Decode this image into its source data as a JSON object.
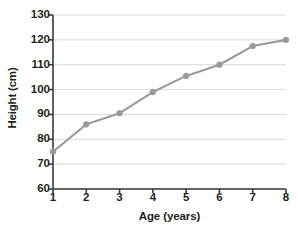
{
  "chart_data": {
    "type": "line",
    "title": "",
    "xlabel": "Age (years)",
    "ylabel": "Height (cm)",
    "x": [
      1,
      2,
      3,
      4,
      5,
      6,
      7,
      8
    ],
    "values": [
      75,
      86,
      90.5,
      99,
      105.5,
      110,
      117.5,
      120
    ],
    "series": [
      {
        "name": "Height",
        "values": [
          75,
          86,
          90.5,
          99,
          105.5,
          110,
          117.5,
          120
        ]
      }
    ],
    "xlim": [
      1,
      8
    ],
    "ylim": [
      60,
      130
    ],
    "x_ticks": [
      1,
      2,
      3,
      4,
      5,
      6,
      7,
      8
    ],
    "x_tick_labels": [
      "1",
      "2",
      "3",
      "4",
      "5",
      "6",
      "7",
      "8"
    ],
    "y_ticks": [
      60,
      70,
      80,
      90,
      100,
      110,
      120,
      130
    ],
    "y_tick_labels": [
      "60",
      "70",
      "80",
      "90",
      "100",
      "110",
      "120",
      "130"
    ],
    "grid": true,
    "grid_axis": "y",
    "legend": false,
    "legend_position": "none",
    "markers": "circle",
    "colors": {
      "line": "#9a9a9a",
      "marker": "#9a9a9a",
      "grid": "#d9d9d9",
      "axis": "#3a3a3a",
      "text": "#231f20",
      "background": "#ffffff"
    }
  }
}
